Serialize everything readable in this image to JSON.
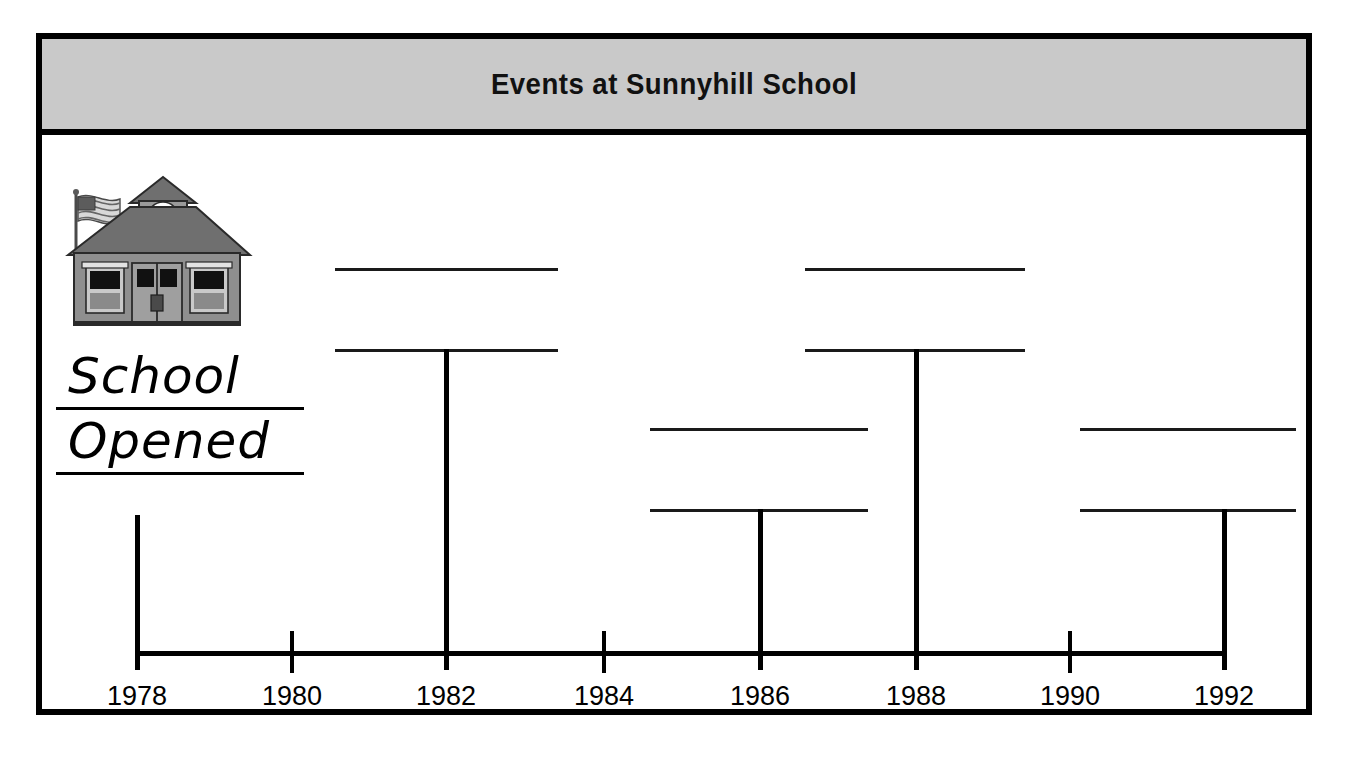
{
  "worksheet": {
    "title": "Events at Sunnyhill School",
    "illustration": "schoolhouse-icon",
    "opened_label": {
      "line1": "School",
      "line2": "Opened"
    }
  },
  "chart_data": {
    "type": "table",
    "title": "Events at Sunnyhill School",
    "xlabel": "",
    "ylabel": "",
    "axis_range": [
      1978,
      1992
    ],
    "tick_step": 2,
    "tick_labels": [
      "1978",
      "1980",
      "1982",
      "1984",
      "1986",
      "1988",
      "1990",
      "1992"
    ],
    "grid": false,
    "legend": "none",
    "events": [
      {
        "year": 1978,
        "label": "School Opened",
        "blank": false,
        "tier": "label",
        "stem_x": 135,
        "stem_top": 512,
        "stem_bottom": 667
      },
      {
        "year": 1982,
        "label": "",
        "blank": true,
        "tier": "upper",
        "callout_left": 335,
        "callout_right": 558,
        "rule_top_y": 265,
        "rule_bottom_y": 346,
        "stem_x": 444,
        "stem_top": 346,
        "stem_bottom": 667
      },
      {
        "year": 1986,
        "label": "",
        "blank": true,
        "tier": "lower",
        "callout_left": 650,
        "callout_right": 868,
        "rule_top_y": 425,
        "rule_bottom_y": 506,
        "stem_x": 758,
        "stem_top": 506,
        "stem_bottom": 667
      },
      {
        "year": 1988,
        "label": "",
        "blank": true,
        "tier": "upper",
        "callout_left": 805,
        "callout_right": 1025,
        "rule_top_y": 265,
        "rule_bottom_y": 346,
        "stem_x": 914,
        "stem_top": 346,
        "stem_bottom": 667
      },
      {
        "year": 1992,
        "label": "",
        "blank": true,
        "tier": "lower",
        "callout_left": 1080,
        "callout_right": 1296,
        "rule_top_y": 425,
        "rule_bottom_y": 506,
        "stem_x": 1222,
        "stem_top": 506,
        "stem_bottom": 667
      }
    ],
    "tick_positions_px": {
      "1978": 135,
      "1980": 290,
      "1982": 444,
      "1984": 602,
      "1986": 758,
      "1988": 914,
      "1990": 1068,
      "1992": 1222
    }
  },
  "colors": {
    "frame": "#000000",
    "title_band": "#c9c9c9",
    "ink": "#000000",
    "paper": "#ffffff",
    "building": "#8f8f8f",
    "roof": "#7a7a7a"
  }
}
